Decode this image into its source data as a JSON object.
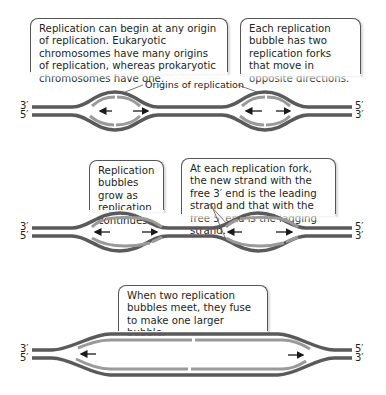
{
  "callouts": {
    "origin_info": "Replication can begin at any origin of replication. Eukaryotic chromosomes have many origins of replication, whereas prokaryotic chromosomes have one.",
    "fork_direction": "Each replication bubble has two replication forks that move in opposite directions.",
    "bubbles_grow": "Replication bubbles grow as replication continues.",
    "leading_lagging": "At each replication fork, the new strand with the free 3′ end is the leading strand and that with the free 5′ end is the lagging strand.",
    "bubbles_fuse": "When two replication bubbles meet, they fuse to make one larger bubble."
  },
  "labels": {
    "origins": "Origins of replication"
  },
  "strand_ends": {
    "left_top": "3′",
    "left_bottom": "5′",
    "right_top": "5′",
    "right_bottom": "3′"
  },
  "colors": {
    "parental_strand": "#5a5a5a",
    "new_strand": "#9a9a9a",
    "arrow": "#1a1a1a"
  }
}
